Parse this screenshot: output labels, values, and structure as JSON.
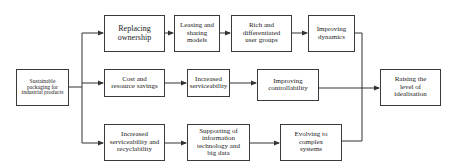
{
  "diagram": {
    "type": "flowchart",
    "source": {
      "id": "source",
      "label": "Sustainable packaging for industrial products"
    },
    "target": {
      "id": "target",
      "label": "Raising the level of idealisation"
    },
    "rows": [
      {
        "name": "top",
        "nodes": [
          {
            "id": "n1",
            "label": "Replacing ownership"
          },
          {
            "id": "n2",
            "label": "Leasing and sharing models"
          },
          {
            "id": "n3",
            "label": "Rich and differentiated user groups"
          },
          {
            "id": "n4",
            "label": "Improving dynamics"
          }
        ]
      },
      {
        "name": "middle",
        "nodes": [
          {
            "id": "n5",
            "label": "Cost and resource savings"
          },
          {
            "id": "n6",
            "label": "Increased serviceability"
          },
          {
            "id": "n7",
            "label": "Improving controllability"
          }
        ]
      },
      {
        "name": "bottom",
        "nodes": [
          {
            "id": "n8",
            "label": "Increased serviceability and recyclability"
          },
          {
            "id": "n9",
            "label": "Supporting of information technology and big data"
          },
          {
            "id": "n10",
            "label": "Evolving to complex systems"
          }
        ]
      }
    ],
    "edges": [
      [
        "source",
        "n1"
      ],
      [
        "source",
        "n5"
      ],
      [
        "source",
        "n8"
      ],
      [
        "n1",
        "n2"
      ],
      [
        "n2",
        "n3"
      ],
      [
        "n3",
        "n4"
      ],
      [
        "n5",
        "n6"
      ],
      [
        "n6",
        "n7"
      ],
      [
        "n8",
        "n9"
      ],
      [
        "n9",
        "n10"
      ],
      [
        "n4",
        "target"
      ],
      [
        "n7",
        "target"
      ],
      [
        "n10",
        "target"
      ]
    ],
    "colors": {
      "line": "#333333",
      "box_border": "#3a3a3a",
      "background": "#ffffff"
    }
  }
}
